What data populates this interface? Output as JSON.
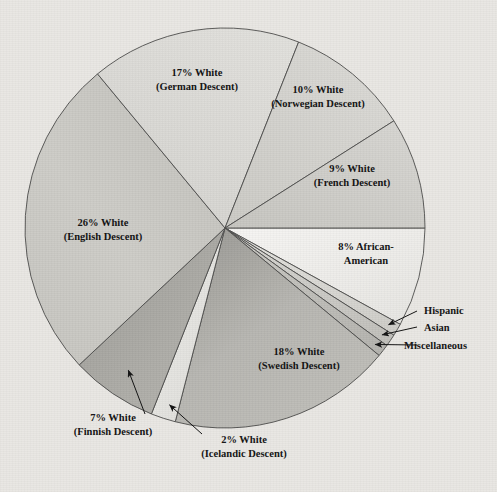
{
  "chart_data": {
    "type": "pie",
    "title": "",
    "legend_position": "callout-labels",
    "total": 100,
    "units": "percent",
    "start_angle_deg": 0,
    "direction": "clockwise",
    "categories": [
      "8% African-American",
      "Hispanic",
      "Asian",
      "Miscellaneous",
      "18% White (Swedish Descent)",
      "2% White (Icelandic Descent)",
      "7% White (Finnish Descent)",
      "26% White (English Descent)",
      "17% White (German Descent)",
      "10% White (Norwegian Descent)",
      "9% White (French Descent)"
    ],
    "values": [
      8,
      1,
      1,
      1,
      18,
      2,
      7,
      26,
      17,
      10,
      9
    ],
    "slices": [
      {
        "key": "african-american",
        "label_line1": "8% African-",
        "label_line2": "American",
        "value": 8,
        "percent_text": "8%",
        "color": "#f2f1ee",
        "color_dark": "#e4e3df",
        "label_x": 366,
        "label_y": 250,
        "callout": false
      },
      {
        "key": "hispanic",
        "label_line1": "Hispanic",
        "label_line2": "",
        "value": 1,
        "percent_text": "",
        "color": "#e0dfdb",
        "color_dark": "#cfcec9",
        "label_x": 424,
        "label_y": 314,
        "callout": true
      },
      {
        "key": "asian",
        "label_line1": "Asian",
        "label_line2": "",
        "value": 1,
        "percent_text": "",
        "color": "#d2d1cd",
        "color_dark": "#c2c1bc",
        "label_x": 424,
        "label_y": 331,
        "callout": true
      },
      {
        "key": "miscellaneous",
        "label_line1": "Miscellaneous",
        "label_line2": "",
        "value": 1,
        "percent_text": "",
        "color": "#c6c5c0",
        "color_dark": "#b7b6b1",
        "label_x": 404,
        "label_y": 349,
        "callout": true
      },
      {
        "key": "swedish",
        "label_line1": "18% White",
        "label_line2": "(Swedish Descent)",
        "value": 18,
        "percent_text": "18%",
        "color": "#b6b5b0",
        "color_dark": "#a3a29d",
        "label_x": 299,
        "label_y": 355,
        "callout": false
      },
      {
        "key": "icelandic",
        "label_line1": "2% White",
        "label_line2": "(Icelandic Descent)",
        "value": 2,
        "percent_text": "2%",
        "color": "#e6e5e1",
        "color_dark": "#d7d6d2",
        "label_x": 244,
        "label_y": 443,
        "callout": true
      },
      {
        "key": "finnish",
        "label_line1": "7% White",
        "label_line2": "(Finnish Descent)",
        "value": 7,
        "percent_text": "7%",
        "color": "#aaa9a4",
        "color_dark": "#999893",
        "label_x": 113,
        "label_y": 421,
        "callout": true
      },
      {
        "key": "english",
        "label_line1": "26% White",
        "label_line2": "(English Descent)",
        "value": 26,
        "percent_text": "26%",
        "color": "#cbcac5",
        "color_dark": "#bcbbb6",
        "label_x": 103,
        "label_y": 226,
        "callout": false
      },
      {
        "key": "german",
        "label_line1": "17% White",
        "label_line2": "(German Descent)",
        "value": 17,
        "percent_text": "17%",
        "color": "#dbdad6",
        "color_dark": "#cdccc8",
        "label_x": 197,
        "label_y": 76,
        "callout": false
      },
      {
        "key": "norwegian",
        "label_line1": "10% White",
        "label_line2": "(Norwegian Descent)",
        "value": 10,
        "percent_text": "10%",
        "color": "#d3d2ce",
        "color_dark": "#c4c3bf",
        "label_x": 318,
        "label_y": 93,
        "callout": false
      },
      {
        "key": "french",
        "label_line1": "9% White",
        "label_line2": "(French Descent)",
        "value": 9,
        "percent_text": "9%",
        "color": "#cdccc7",
        "color_dark": "#bebdb8",
        "label_x": 352,
        "label_y": 172,
        "callout": false
      }
    ],
    "geometry": {
      "center_x": 225,
      "center_y": 228,
      "radius": 200,
      "outline_color": "#4a4a48",
      "background_color": "#e9e7e3"
    }
  }
}
